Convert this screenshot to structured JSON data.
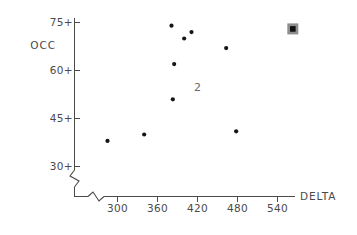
{
  "chart_data": {
    "type": "scatter",
    "title": "",
    "xlabel": "DELTA",
    "ylabel": "OCC",
    "xlim": [
      270,
      575
    ],
    "ylim": [
      27,
      78
    ],
    "grid": false,
    "legend": null,
    "axis_break_x": true,
    "axis_break_y": true,
    "xticks": [
      300,
      360,
      420,
      480,
      540
    ],
    "yticks": [
      30,
      45,
      60,
      75
    ],
    "xtick_labels": [
      "300",
      "360",
      "420",
      "480",
      "540"
    ],
    "ytick_labels": [
      "30+",
      "45+",
      "60+",
      "75+"
    ],
    "points": [
      {
        "x": 285,
        "y": 38,
        "marker": "dot"
      },
      {
        "x": 340,
        "y": 40,
        "marker": "dot"
      },
      {
        "x": 381,
        "y": 74,
        "marker": "dot"
      },
      {
        "x": 411,
        "y": 72,
        "marker": "dot"
      },
      {
        "x": 400,
        "y": 70,
        "marker": "dot"
      },
      {
        "x": 385,
        "y": 62,
        "marker": "dot"
      },
      {
        "x": 383,
        "y": 51,
        "marker": "dot"
      },
      {
        "x": 463,
        "y": 67,
        "marker": "dot"
      },
      {
        "x": 478,
        "y": 41,
        "marker": "dot"
      },
      {
        "x": 563,
        "y": 73,
        "marker": "selected-square"
      }
    ],
    "annotations": [
      {
        "text": "2",
        "x": 420,
        "y": 55,
        "meaning": "two-overlapping-points"
      }
    ]
  },
  "axes": {
    "y_label": "OCC",
    "x_label": "DELTA"
  }
}
